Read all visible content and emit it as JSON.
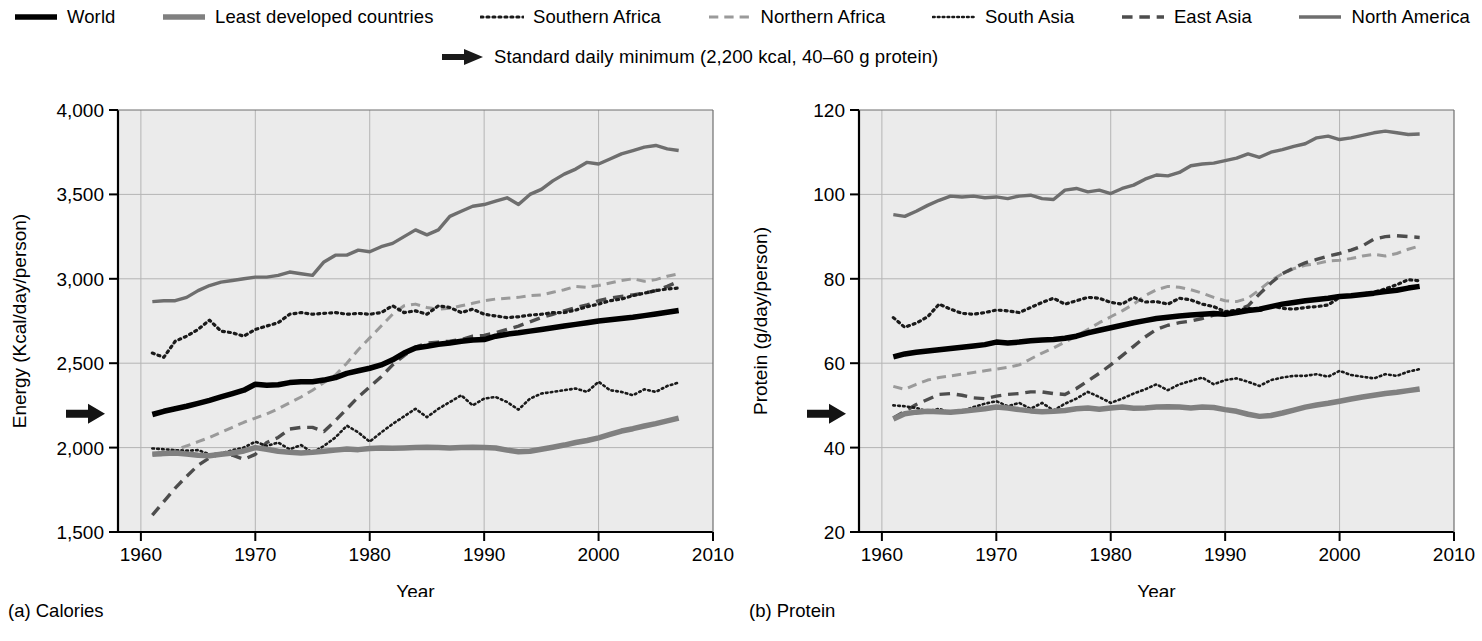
{
  "legend": {
    "items": [
      {
        "label": "World",
        "style": "solid",
        "color": "#000000",
        "width": 5.5,
        "key": "world"
      },
      {
        "label": "Least developed countries",
        "style": "solid",
        "color": "#808080",
        "width": 5.5,
        "key": "ldc"
      },
      {
        "label": "Southern Africa",
        "style": "dotted",
        "color": "#1a1a1a",
        "width": 3.2,
        "key": "southern_africa"
      },
      {
        "label": "Northern Africa",
        "style": "dashed",
        "color": "#9a9a9a",
        "width": 3.0,
        "key": "northern_africa"
      },
      {
        "label": "South Asia",
        "style": "dotted",
        "color": "#1a1a1a",
        "width": 2.6,
        "key": "south_asia"
      },
      {
        "label": "East Asia",
        "style": "dashed",
        "color": "#4d4d4d",
        "width": 3.4,
        "key": "east_asia"
      },
      {
        "label": "North America",
        "style": "solid",
        "color": "#6e6e6e",
        "width": 3.4,
        "key": "north_america"
      }
    ],
    "annotation": {
      "label": "Standard daily minimum (2,200 kcal, 40–60 g protein)",
      "icon": "right-arrow-icon"
    }
  },
  "panels": [
    {
      "caption": "(a) Calories",
      "marker_value": 2200
    },
    {
      "caption": "(b) Protein",
      "marker_value": 48
    }
  ],
  "chart_data": [
    {
      "type": "line",
      "title": "(a) Calories",
      "xlabel": "Year",
      "ylabel": "Energy (Kcal/day/person)",
      "xlim": [
        1958,
        2010
      ],
      "ylim": [
        1500,
        4000
      ],
      "xticks": [
        1960,
        1970,
        1980,
        1990,
        2000,
        2010
      ],
      "yticks": [
        1500,
        2000,
        2500,
        3000,
        3500,
        4000
      ],
      "ytick_labels": [
        "1,500",
        "2,000",
        "2,500",
        "3,000",
        "3,500",
        "4,000"
      ],
      "xtick_labels": [
        "1960",
        "1970",
        "1980",
        "1990",
        "2000",
        "2010"
      ],
      "grid": true,
      "legend_position": "top",
      "annotation_marker": {
        "value": 2200,
        "label": "Standard daily minimum"
      },
      "x": [
        1961,
        1962,
        1963,
        1964,
        1965,
        1966,
        1967,
        1968,
        1969,
        1970,
        1971,
        1972,
        1973,
        1974,
        1975,
        1976,
        1977,
        1978,
        1979,
        1980,
        1981,
        1982,
        1983,
        1984,
        1985,
        1986,
        1987,
        1988,
        1989,
        1990,
        1991,
        1992,
        1993,
        1994,
        1995,
        1996,
        1997,
        1998,
        1999,
        2000,
        2001,
        2002,
        2003,
        2004,
        2005,
        2006,
        2007
      ],
      "series": [
        {
          "name": "World",
          "key": "world",
          "values": [
            2196,
            2215,
            2230,
            2245,
            2262,
            2280,
            2300,
            2320,
            2340,
            2375,
            2370,
            2372,
            2385,
            2390,
            2390,
            2400,
            2415,
            2440,
            2455,
            2470,
            2490,
            2520,
            2560,
            2590,
            2600,
            2612,
            2620,
            2630,
            2638,
            2640,
            2660,
            2672,
            2680,
            2690,
            2700,
            2710,
            2720,
            2730,
            2740,
            2750,
            2758,
            2765,
            2772,
            2782,
            2792,
            2802,
            2812
          ]
        },
        {
          "name": "Least developed countries",
          "key": "ldc",
          "values": [
            1960,
            1965,
            1968,
            1962,
            1955,
            1952,
            1960,
            1968,
            1980,
            2000,
            1990,
            1978,
            1972,
            1968,
            1972,
            1978,
            1985,
            1992,
            1988,
            1995,
            1998,
            1996,
            1998,
            2000,
            2002,
            2000,
            1998,
            2000,
            2002,
            2000,
            1998,
            1985,
            1975,
            1978,
            1990,
            2002,
            2015,
            2030,
            2042,
            2058,
            2078,
            2098,
            2112,
            2128,
            2142,
            2158,
            2175
          ]
        },
        {
          "name": "Southern Africa",
          "key": "southern_africa",
          "values": [
            2560,
            2535,
            2630,
            2660,
            2700,
            2755,
            2690,
            2680,
            2660,
            2700,
            2720,
            2740,
            2790,
            2800,
            2790,
            2795,
            2800,
            2790,
            2795,
            2790,
            2800,
            2840,
            2800,
            2810,
            2790,
            2840,
            2830,
            2800,
            2820,
            2790,
            2780,
            2770,
            2775,
            2785,
            2790,
            2800,
            2800,
            2815,
            2835,
            2850,
            2870,
            2880,
            2900,
            2915,
            2930,
            2940,
            2945
          ]
        },
        {
          "name": "Northern Africa",
          "key": "northern_africa",
          "values": [
            1960,
            1958,
            1985,
            2010,
            2035,
            2060,
            2090,
            2120,
            2150,
            2175,
            2200,
            2230,
            2265,
            2300,
            2340,
            2385,
            2430,
            2500,
            2580,
            2650,
            2720,
            2790,
            2840,
            2850,
            2830,
            2820,
            2825,
            2840,
            2855,
            2870,
            2880,
            2885,
            2890,
            2900,
            2905,
            2920,
            2935,
            2955,
            2950,
            2960,
            2975,
            2990,
            3000,
            2985,
            2995,
            3015,
            3030
          ]
        },
        {
          "name": "South Asia",
          "key": "south_asia",
          "values": [
            1995,
            1990,
            1985,
            1982,
            1985,
            1960,
            1965,
            1985,
            2000,
            2035,
            2010,
            2030,
            1990,
            2015,
            1970,
            2010,
            2060,
            2130,
            2090,
            2035,
            2090,
            2140,
            2185,
            2230,
            2180,
            2230,
            2270,
            2310,
            2250,
            2290,
            2300,
            2270,
            2225,
            2290,
            2320,
            2330,
            2340,
            2350,
            2330,
            2390,
            2340,
            2330,
            2310,
            2345,
            2330,
            2365,
            2385
          ]
        },
        {
          "name": "East Asia",
          "key": "east_asia",
          "values": [
            1600,
            1680,
            1760,
            1830,
            1895,
            1940,
            1965,
            1955,
            1930,
            1960,
            2030,
            2060,
            2110,
            2120,
            2120,
            2095,
            2160,
            2230,
            2300,
            2360,
            2420,
            2490,
            2545,
            2595,
            2620,
            2625,
            2630,
            2640,
            2660,
            2665,
            2680,
            2700,
            2720,
            2745,
            2770,
            2790,
            2810,
            2830,
            2845,
            2870,
            2885,
            2895,
            2905,
            2915,
            2930,
            2955,
            2985
          ]
        },
        {
          "name": "North America",
          "key": "north_america",
          "values": [
            2865,
            2870,
            2870,
            2890,
            2930,
            2960,
            2980,
            2990,
            3000,
            3010,
            3010,
            3020,
            3040,
            3030,
            3020,
            3100,
            3140,
            3140,
            3170,
            3160,
            3190,
            3210,
            3250,
            3290,
            3260,
            3290,
            3370,
            3400,
            3430,
            3440,
            3460,
            3480,
            3440,
            3500,
            3530,
            3580,
            3620,
            3650,
            3690,
            3680,
            3710,
            3740,
            3760,
            3780,
            3790,
            3770,
            3760
          ]
        }
      ]
    },
    {
      "type": "line",
      "title": "(b) Protein",
      "xlabel": "Year",
      "ylabel": "Protein (g/day/person)",
      "xlim": [
        1958,
        2010
      ],
      "ylim": [
        20,
        120
      ],
      "xticks": [
        1960,
        1970,
        1980,
        1990,
        2000,
        2010
      ],
      "yticks": [
        20,
        40,
        60,
        80,
        100,
        120
      ],
      "ytick_labels": [
        "20",
        "40",
        "60",
        "80",
        "100",
        "120"
      ],
      "xtick_labels": [
        "1960",
        "1970",
        "1980",
        "1990",
        "2000",
        "2010"
      ],
      "grid": true,
      "legend_position": "top",
      "annotation_marker": {
        "value": 48,
        "label": "Standard daily minimum"
      },
      "x": [
        1961,
        1962,
        1963,
        1964,
        1965,
        1966,
        1967,
        1968,
        1969,
        1970,
        1971,
        1972,
        1973,
        1974,
        1975,
        1976,
        1977,
        1978,
        1979,
        1980,
        1981,
        1982,
        1983,
        1984,
        1985,
        1986,
        1987,
        1988,
        1989,
        1990,
        1991,
        1992,
        1993,
        1994,
        1995,
        1996,
        1997,
        1998,
        1999,
        2000,
        2001,
        2002,
        2003,
        2004,
        2005,
        2006,
        2007
      ],
      "series": [
        {
          "name": "World",
          "key": "world",
          "values": [
            61.5,
            62.2,
            62.6,
            62.9,
            63.2,
            63.5,
            63.8,
            64.1,
            64.4,
            65.0,
            64.8,
            65.0,
            65.3,
            65.5,
            65.6,
            65.9,
            66.4,
            67.2,
            67.8,
            68.4,
            69.0,
            69.6,
            70.1,
            70.6,
            70.9,
            71.2,
            71.4,
            71.6,
            71.8,
            71.6,
            72.0,
            72.5,
            72.8,
            73.4,
            74.0,
            74.4,
            74.8,
            75.1,
            75.4,
            75.8,
            76.0,
            76.3,
            76.6,
            77.0,
            77.3,
            77.8,
            78.2
          ]
        },
        {
          "name": "Least developed countries",
          "key": "ldc",
          "values": [
            46.8,
            48.0,
            48.4,
            48.6,
            48.5,
            48.4,
            48.6,
            48.9,
            49.2,
            49.6,
            49.4,
            49.0,
            48.7,
            48.5,
            48.6,
            48.8,
            49.2,
            49.4,
            49.1,
            49.4,
            49.6,
            49.3,
            49.4,
            49.6,
            49.7,
            49.6,
            49.4,
            49.6,
            49.5,
            49.0,
            48.6,
            47.9,
            47.4,
            47.6,
            48.2,
            48.9,
            49.6,
            50.1,
            50.5,
            51.0,
            51.5,
            52.0,
            52.4,
            52.8,
            53.1,
            53.5,
            53.9
          ]
        },
        {
          "name": "Southern Africa",
          "key": "southern_africa",
          "values": [
            70.8,
            68.5,
            69.5,
            71.0,
            74.0,
            72.8,
            71.8,
            71.6,
            72.0,
            72.6,
            72.4,
            72.0,
            73.2,
            74.4,
            75.4,
            74.0,
            74.8,
            75.6,
            75.4,
            74.4,
            74.0,
            75.6,
            74.5,
            74.6,
            74.0,
            75.4,
            75.0,
            74.0,
            73.4,
            72.2,
            72.6,
            73.0,
            72.4,
            73.6,
            73.0,
            72.8,
            73.2,
            73.4,
            73.8,
            75.6,
            76.0,
            76.4,
            76.8,
            77.6,
            78.6,
            79.8,
            79.5
          ]
        },
        {
          "name": "Northern Africa",
          "key": "northern_africa",
          "values": [
            54.5,
            53.8,
            55.0,
            56.0,
            56.6,
            57.0,
            57.4,
            57.8,
            58.2,
            58.6,
            59.0,
            59.6,
            61.0,
            62.4,
            63.6,
            65.0,
            66.4,
            68.0,
            69.6,
            71.0,
            72.4,
            74.0,
            76.0,
            77.4,
            78.2,
            78.0,
            77.4,
            76.6,
            75.6,
            74.8,
            74.6,
            75.4,
            77.4,
            79.6,
            81.2,
            82.4,
            83.2,
            83.6,
            84.2,
            84.4,
            84.8,
            85.4,
            85.8,
            85.4,
            86.0,
            87.0,
            87.8
          ]
        },
        {
          "name": "South Asia",
          "key": "south_asia",
          "values": [
            50.0,
            49.8,
            49.4,
            48.6,
            49.2,
            48.2,
            48.6,
            49.6,
            50.4,
            51.0,
            49.8,
            50.6,
            49.2,
            50.6,
            48.8,
            50.4,
            51.6,
            53.2,
            52.0,
            50.6,
            51.6,
            52.8,
            53.8,
            55.0,
            53.6,
            55.0,
            55.8,
            56.6,
            55.0,
            56.0,
            56.4,
            55.6,
            54.6,
            56.0,
            56.6,
            57.0,
            57.0,
            57.4,
            56.8,
            58.2,
            57.2,
            56.8,
            56.4,
            57.4,
            57.0,
            58.0,
            58.6
          ]
        },
        {
          "name": "East Asia",
          "key": "east_asia",
          "values": [
            47.0,
            48.6,
            50.2,
            51.4,
            52.6,
            52.8,
            52.4,
            51.8,
            51.6,
            52.2,
            52.6,
            52.8,
            53.2,
            53.2,
            52.8,
            52.6,
            54.0,
            55.8,
            57.6,
            59.6,
            61.8,
            64.0,
            66.2,
            68.0,
            69.0,
            69.6,
            70.0,
            70.6,
            71.4,
            71.8,
            72.4,
            73.6,
            76.4,
            79.0,
            81.2,
            82.6,
            83.8,
            84.6,
            85.4,
            86.0,
            86.8,
            87.8,
            89.4,
            90.0,
            90.2,
            90.0,
            89.8
          ]
        },
        {
          "name": "North America",
          "key": "north_america",
          "values": [
            95.2,
            94.8,
            96.0,
            97.4,
            98.6,
            99.6,
            99.4,
            99.6,
            99.2,
            99.4,
            99.0,
            99.6,
            99.8,
            99.0,
            98.8,
            101.0,
            101.4,
            100.6,
            101.0,
            100.2,
            101.4,
            102.2,
            103.6,
            104.6,
            104.4,
            105.2,
            106.8,
            107.2,
            107.4,
            108.0,
            108.6,
            109.6,
            108.8,
            110.0,
            110.6,
            111.4,
            112.0,
            113.4,
            113.8,
            113.0,
            113.4,
            114.0,
            114.6,
            115.0,
            114.6,
            114.2,
            114.3
          ]
        }
      ]
    }
  ]
}
